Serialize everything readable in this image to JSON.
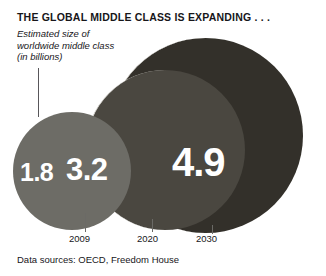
{
  "header": {
    "title": "THE GLOBAL MIDDLE CLASS IS EXPANDING . . .",
    "caption_line_1": "Estimated size of",
    "caption_line_2": "worldwide middle class",
    "caption_line_3": "(in billions)"
  },
  "footer": {
    "source": "Data sources: OECD, Freedom House"
  },
  "chart_data": {
    "type": "bubble",
    "title": "THE GLOBAL MIDDLE CLASS IS EXPANDING . . .",
    "subtitle": "Estimated size of worldwide middle class (in billions)",
    "xlabel": "",
    "ylabel": "",
    "unit": "billions",
    "grid": false,
    "legend": null,
    "source": "Data sources: OECD, Freedom House",
    "categories": [
      "2009",
      "2020",
      "2030"
    ],
    "values": [
      1.8,
      3.2,
      4.9
    ],
    "value_labels": [
      "1.8",
      "3.2",
      "4.9"
    ],
    "colors": [
      "#6d6c66",
      "#4a4740",
      "#33302a"
    ],
    "points": [
      {
        "year": "2009",
        "value": 1.8,
        "label": "1.8",
        "color": "#6d6c66"
      },
      {
        "year": "2020",
        "value": 3.2,
        "label": "3.2",
        "color": "#4a4740"
      },
      {
        "year": "2030",
        "value": 4.9,
        "label": "4.9",
        "color": "#33302a"
      }
    ]
  }
}
